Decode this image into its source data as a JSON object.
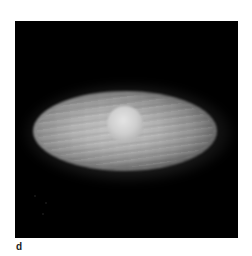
{
  "figure": {
    "panel_label": "d",
    "colors": {
      "background": "#ffffff",
      "panel": "#000000",
      "disk": "#b4b4b4",
      "core": "#e4e4e4",
      "label": "#222222"
    }
  }
}
